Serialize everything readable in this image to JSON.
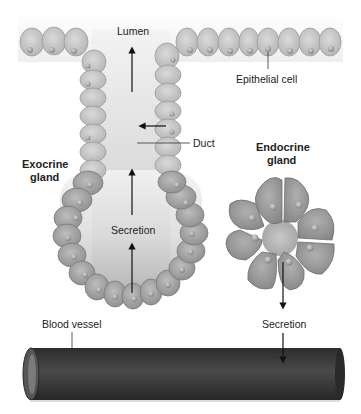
{
  "diagram": {
    "labels": {
      "lumen": "Lumen",
      "epithelial_cell": "Epithelial cell",
      "duct": "Duct",
      "exocrine_line1": "Exocrine",
      "exocrine_line2": "gland",
      "endocrine_line1": "Endocrine",
      "endocrine_line2": "gland",
      "secretion_exocrine": "Secretion",
      "secretion_endocrine": "Secretion",
      "blood_vessel": "Blood vessel"
    },
    "colors": {
      "background": "#ffffff",
      "top_band": "#f0f0f0",
      "lumen_top": "#f2f2f2",
      "lumen_bottom": "#b5b5b5",
      "duct_cell": "#c9c9c9",
      "secretory_cell": "#a3a3a3",
      "endocrine_cell": "#9a9a9a",
      "nucleus": "#8f8f8f",
      "vessel": "#3a3a3a",
      "text": "#222222",
      "arrow": "#111111"
    }
  }
}
